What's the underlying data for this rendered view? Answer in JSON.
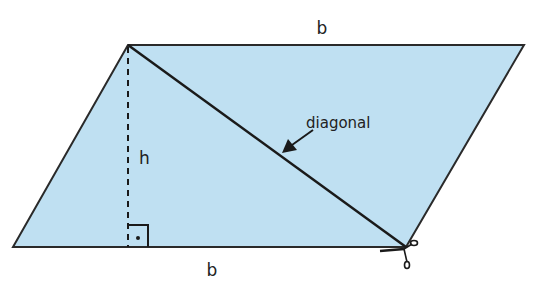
{
  "figure": {
    "type": "parallelogram-area-diagram",
    "fill_color": "#bfe0f2",
    "stroke_color": "#2a2a2a",
    "labels": {
      "top_base": "b",
      "bottom_base": "b",
      "height": "h",
      "diagonal": "diagonal"
    },
    "right_angle_marker": "•",
    "scissors_icon": "scissors-icon"
  }
}
